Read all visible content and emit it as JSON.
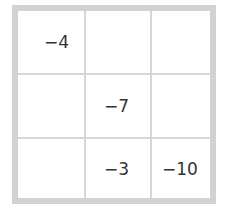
{
  "grid": {
    "rows": [
      [
        "−4",
        "",
        ""
      ],
      [
        "",
        "−7",
        ""
      ],
      [
        "",
        "−3",
        "−10"
      ]
    ]
  }
}
